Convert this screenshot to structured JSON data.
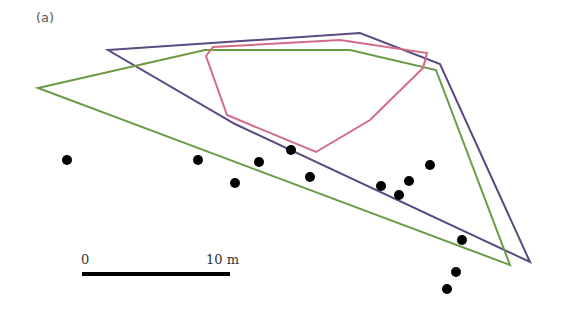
{
  "panel_label": "(a)",
  "scale_bar": {
    "start_label": "0",
    "end_label": "10 m",
    "x1": 82,
    "x2": 230,
    "y": 274,
    "color": "#000000"
  },
  "polygons": [
    {
      "name": "purple-hull",
      "color": "#5b4a82",
      "points": [
        [
          108,
          50
        ],
        [
          360,
          33
        ],
        [
          440,
          64
        ],
        [
          530,
          262
        ],
        [
          235,
          124
        ]
      ]
    },
    {
      "name": "green-hull",
      "color": "#6b9a45",
      "points": [
        [
          38,
          88
        ],
        [
          205,
          50
        ],
        [
          350,
          50
        ],
        [
          436,
          70
        ],
        [
          510,
          265
        ]
      ]
    },
    {
      "name": "pink-hull",
      "color": "#d46a8a",
      "points": [
        [
          206,
          56
        ],
        [
          213,
          47
        ],
        [
          340,
          40
        ],
        [
          427,
          53
        ],
        [
          423,
          68
        ],
        [
          370,
          120
        ],
        [
          316,
          152
        ],
        [
          227,
          115
        ]
      ]
    }
  ],
  "points": [
    [
      67,
      160
    ],
    [
      198,
      160
    ],
    [
      235,
      183
    ],
    [
      259,
      162
    ],
    [
      291,
      150
    ],
    [
      310,
      177
    ],
    [
      381,
      186
    ],
    [
      399,
      195
    ],
    [
      409,
      181
    ],
    [
      430,
      165
    ],
    [
      462,
      240
    ],
    [
      456,
      272
    ],
    [
      447,
      289
    ]
  ],
  "point_color": "#000000"
}
